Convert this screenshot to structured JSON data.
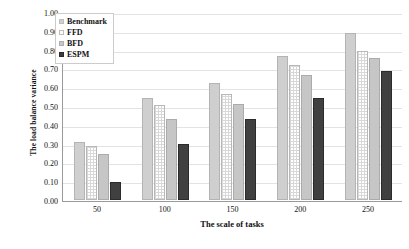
{
  "chart_data": {
    "type": "bar",
    "title": "",
    "xlabel": "The scale of tasks",
    "ylabel": "The load balance variance",
    "categories": [
      "50",
      "100",
      "150",
      "200",
      "250"
    ],
    "series": [
      {
        "name": "Benchmark",
        "color": "#cfcfcf",
        "values": [
          0.31,
          0.545,
          0.625,
          0.765,
          0.89
        ]
      },
      {
        "name": "FFD",
        "color": "#ffffff",
        "values": [
          0.285,
          0.505,
          0.565,
          0.72,
          0.79
        ]
      },
      {
        "name": "BFD",
        "color": "#c6c6c6",
        "values": [
          0.245,
          0.43,
          0.51,
          0.665,
          0.755
        ]
      },
      {
        "name": "ESPM",
        "color": "#404040",
        "values": [
          0.095,
          0.3,
          0.43,
          0.545,
          0.685
        ]
      }
    ],
    "ylim": [
      0.0,
      1.0
    ],
    "ytick_step": 0.1,
    "yticks": [
      "1.00",
      "0.90",
      "0.80",
      "0.70",
      "0.60",
      "0.50",
      "0.40",
      "0.30",
      "0.20",
      "0.10",
      "0.00"
    ],
    "grid": true,
    "grid_axis": "y",
    "legend_position": "top-left",
    "legend_entries": [
      "Benchmark",
      "FFD",
      "BFD",
      "ESPM"
    ]
  }
}
